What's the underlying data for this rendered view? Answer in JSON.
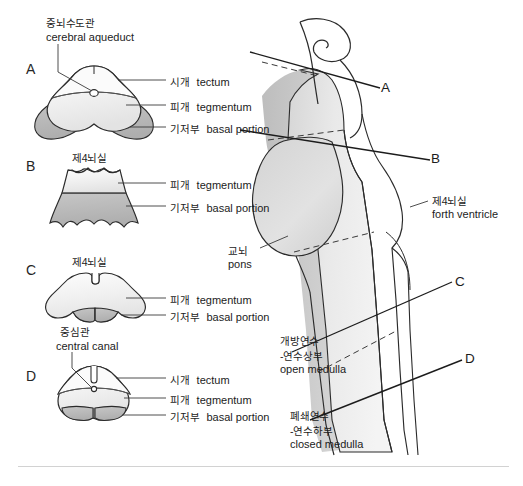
{
  "figure": {
    "title_semantic": "brainstem-cross-sections-and-sagittal-view",
    "panel_letters": [
      "A",
      "B",
      "C",
      "D"
    ],
    "section_line_letters": [
      "A",
      "B",
      "C",
      "D"
    ],
    "colors": {
      "outline": "#2b2b2b",
      "tegmentum_fill": "#f2f2f2",
      "basal_fill": "#b9b9b9",
      "tectum_fill": "#fafafa",
      "sagittal_light": "#ececec",
      "sagittal_mid": "#dcdcdc",
      "sagittal_dark": "#c4c4c4",
      "text": "#1c1c1c",
      "rule": "#d2d2d2"
    }
  },
  "labels": {
    "cerebral_aqueduct": {
      "ko": "중뇌수도관",
      "en": "cerebral aqueduct"
    },
    "central_canal": {
      "ko": "중심관",
      "en": "central canal"
    },
    "fourth_ventricle_ko": "제4뇌실",
    "fourth_ventricle": {
      "ko": "제4뇌실",
      "en": "forth ventricle"
    },
    "tectum": {
      "ko": "시개",
      "en": "tectum"
    },
    "tegmentum": {
      "ko": "피개",
      "en": "tegmentum"
    },
    "basal_portion": {
      "ko": "기저부",
      "en": "basal portion"
    },
    "pons": {
      "ko": "교뇌",
      "en": "pons"
    },
    "open_medulla": {
      "ko": "개방연수",
      "ko2": "-연수상부",
      "en": "open medulla"
    },
    "closed_medulla": {
      "ko": "폐쇄연수",
      "ko2": "-연수하부",
      "en": "closed medulla"
    }
  },
  "panels": {
    "A": {
      "letter": "A",
      "callouts": [
        "cerebral aqueduct",
        "tectum",
        "tegmentum",
        "basal portion"
      ]
    },
    "B": {
      "letter": "B",
      "callouts": [
        "forth ventricle",
        "tegmentum",
        "basal portion"
      ]
    },
    "C": {
      "letter": "C",
      "callouts": [
        "forth ventricle",
        "tegmentum",
        "basal portion"
      ]
    },
    "D": {
      "letter": "D",
      "callouts": [
        "central canal",
        "tectum",
        "tegmentum",
        "basal portion"
      ]
    }
  },
  "sagittal": {
    "section_lines": [
      {
        "letter": "A",
        "label_x": 386,
        "label_y": 87
      },
      {
        "letter": "B",
        "label_x": 436,
        "label_y": 158
      },
      {
        "letter": "C",
        "label_x": 460,
        "label_y": 281
      },
      {
        "letter": "D",
        "label_x": 470,
        "label_y": 358
      }
    ],
    "callouts": [
      "pons",
      "forth ventricle",
      "open medulla",
      "closed medulla"
    ]
  }
}
